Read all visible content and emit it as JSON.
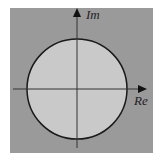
{
  "diagram": {
    "title": "",
    "type": "complex-plane-unit-circle",
    "axes": {
      "real_label": "Re",
      "imaginary_label": "Im"
    },
    "colors": {
      "outer_background": "#9a9a9a",
      "disk_fill": "#c9c9c9",
      "stroke": "#1a1a1a",
      "page": "#ffffff"
    },
    "geometry": {
      "plane_rect": [
        10,
        8,
        143,
        145
      ],
      "center": [
        77,
        89
      ],
      "radius": 50
    }
  }
}
